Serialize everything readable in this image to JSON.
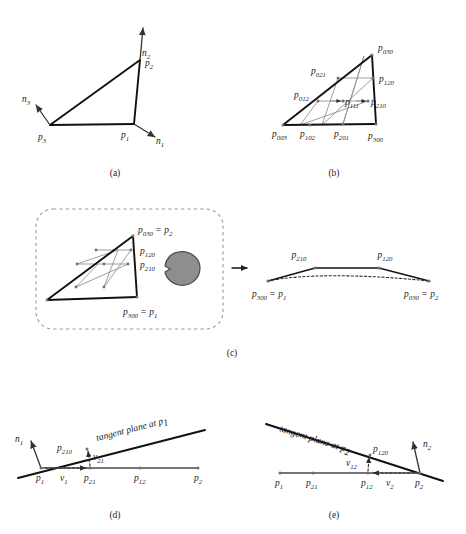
{
  "figure": {
    "panels": [
      {
        "id": "a",
        "caption": "(a)"
      },
      {
        "id": "b",
        "caption": "(b)"
      },
      {
        "id": "c",
        "caption": "(c)"
      },
      {
        "id": "d",
        "caption": "(d)"
      },
      {
        "id": "e",
        "caption": "(e)"
      }
    ]
  },
  "panel_a": {
    "caption": "(a)",
    "vertices": [
      {
        "name": "p1",
        "base": "p",
        "sub": "1"
      },
      {
        "name": "p2",
        "base": "p",
        "sub": "2"
      },
      {
        "name": "p3",
        "base": "p",
        "sub": "3"
      }
    ],
    "normals": [
      {
        "name": "n1",
        "base": "n",
        "sub": "1"
      },
      {
        "name": "n2",
        "base": "n",
        "sub": "2"
      },
      {
        "name": "n3",
        "base": "n",
        "sub": "3"
      }
    ]
  },
  "panel_b": {
    "caption": "(b)",
    "control_points": [
      {
        "base": "p",
        "sub": "030"
      },
      {
        "base": "p",
        "sub": "021"
      },
      {
        "base": "p",
        "sub": "120"
      },
      {
        "base": "p",
        "sub": "012"
      },
      {
        "base": "p",
        "sub": "111"
      },
      {
        "base": "p",
        "sub": "210"
      },
      {
        "base": "p",
        "sub": "003"
      },
      {
        "base": "p",
        "sub": "102"
      },
      {
        "base": "p",
        "sub": "201"
      },
      {
        "base": "p",
        "sub": "300"
      }
    ]
  },
  "panel_c": {
    "caption": "(c)",
    "left_labels": [
      {
        "base": "p",
        "sub": "030",
        "eq": " = ",
        "base2": "p",
        "sub2": "2"
      },
      {
        "base": "p",
        "sub": "120"
      },
      {
        "base": "p",
        "sub": "210"
      },
      {
        "base": "p",
        "sub": "300",
        "eq": " = ",
        "base2": "p",
        "sub2": "1"
      }
    ],
    "right_labels": [
      {
        "base": "p",
        "sub": "210"
      },
      {
        "base": "p",
        "sub": "120"
      },
      {
        "base": "p",
        "sub": "300",
        "eq": " = ",
        "base2": "p",
        "sub2": "1"
      },
      {
        "base": "p",
        "sub": "030",
        "eq": " = ",
        "base2": "p",
        "sub2": "2"
      }
    ],
    "arrow": "right-arrow"
  },
  "panel_d": {
    "caption": "(d)",
    "tangent_text": "tangent plane at",
    "tangent_point": {
      "base": "p",
      "sub": "1"
    },
    "labels": [
      {
        "base": "n",
        "sub": "1"
      },
      {
        "base": "p",
        "sub": "210"
      },
      {
        "base": "v",
        "sub": "21"
      },
      {
        "base": "p",
        "sub": "1"
      },
      {
        "base": "v",
        "sub": "1"
      },
      {
        "base": "p",
        "sub": "21"
      },
      {
        "base": "p",
        "sub": "12"
      },
      {
        "base": "p",
        "sub": "2"
      }
    ]
  },
  "panel_e": {
    "caption": "(e)",
    "tangent_text": "tangent plane at",
    "tangent_point": {
      "base": "p",
      "sub": "2"
    },
    "labels": [
      {
        "base": "p",
        "sub": "120"
      },
      {
        "base": "n",
        "sub": "2"
      },
      {
        "base": "v",
        "sub": "12"
      },
      {
        "base": "v",
        "sub": "2"
      },
      {
        "base": "p",
        "sub": "1"
      },
      {
        "base": "p",
        "sub": "21"
      },
      {
        "base": "p",
        "sub": "12"
      },
      {
        "base": "p",
        "sub": "2"
      }
    ]
  },
  "colors": {
    "line": "#111111",
    "net": "#8c8c8c",
    "blob_fill": "#8e8e8e",
    "dash": "#9a9a9a",
    "text": "#1c1c1c"
  }
}
